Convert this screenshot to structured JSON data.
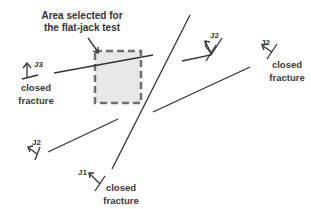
{
  "diagram": {
    "caption": {
      "line1": "Area selected for",
      "line2": "the flat-jack test"
    },
    "joints": {
      "j3_left": "J3",
      "j2_top": "J2",
      "j2_right": "J2",
      "j2_bottom_left": "J2",
      "j1_bottom": "J1"
    },
    "notes": {
      "left": {
        "line1": "closed",
        "line2": "fracture"
      },
      "right": {
        "line1": "closed",
        "line2": "fracture"
      },
      "bottom": {
        "line1": "closed",
        "line2": "fracture"
      }
    },
    "colors": {
      "line": "#333333",
      "box_fill": "#e8e8e8",
      "box_border": "#707070",
      "text": "#333333"
    }
  }
}
